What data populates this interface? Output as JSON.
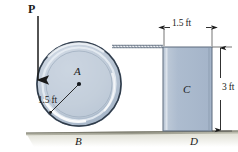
{
  "figure": {
    "labels": {
      "force_P": "P",
      "wheel_center": "A",
      "wheel_radius": "1.5 ft",
      "wheel_contact": "B",
      "block": "C",
      "block_contact": "D",
      "block_width": "1.5 ft",
      "block_height": "3 ft"
    },
    "colors": {
      "wheel_fill": "#b7c4d6",
      "wheel_inner": "#c3cfdd",
      "block_fill": "#aebdd1",
      "ground": "#8c8c80",
      "line": "#1a1a1a",
      "dim_line": "#3a3a3a",
      "cord": "#9aa4b0"
    },
    "geometry": {
      "wheel_center_x": 79,
      "wheel_center_y": 84,
      "wheel_radius_px": 43,
      "ground_y": 131,
      "block_left": 163,
      "block_right": 212,
      "block_top": 47,
      "block_bottom": 131,
      "cord_y": 46,
      "force_x": 38,
      "force_top_y": 16,
      "force_tip_y": 84
    }
  }
}
